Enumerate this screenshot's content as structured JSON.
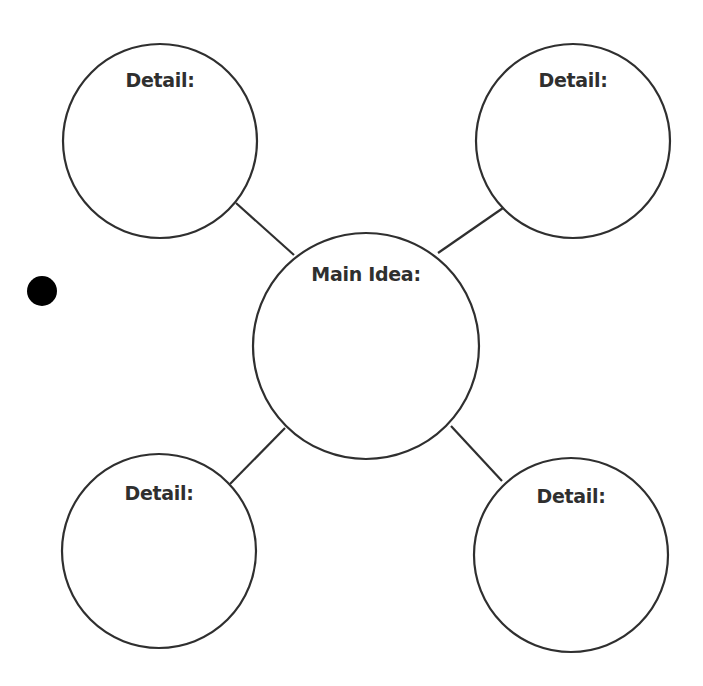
{
  "diagram": {
    "type": "main-idea-and-details web",
    "colors": {
      "stroke": "#2f2f2f",
      "text": "#2f2f2f",
      "background": "#ffffff",
      "dot": "#000000"
    },
    "main_idea": {
      "label": "Main Idea:",
      "cx": 366,
      "cy": 346,
      "r": 113
    },
    "details": [
      {
        "label": "Detail:",
        "position": "top-left",
        "cx": 160,
        "cy": 141,
        "r": 97
      },
      {
        "label": "Detail:",
        "position": "top-right",
        "cx": 573,
        "cy": 141,
        "r": 97
      },
      {
        "label": "Detail:",
        "position": "bottom-left",
        "cx": 159,
        "cy": 551,
        "r": 97
      },
      {
        "label": "Detail:",
        "position": "bottom-right",
        "cx": 571,
        "cy": 555,
        "r": 97
      }
    ],
    "connectors": [
      {
        "from": "top-left",
        "x1": 236,
        "y1": 203,
        "x2": 294,
        "y2": 255
      },
      {
        "from": "top-right",
        "x1": 503,
        "y1": 208,
        "x2": 438,
        "y2": 253
      },
      {
        "from": "bottom-left",
        "x1": 230,
        "y1": 484,
        "x2": 285,
        "y2": 428
      },
      {
        "from": "bottom-right",
        "x1": 502,
        "y1": 481,
        "x2": 451,
        "y2": 426
      }
    ],
    "bullet_dot": {
      "cx": 42,
      "cy": 291,
      "r": 15
    }
  }
}
